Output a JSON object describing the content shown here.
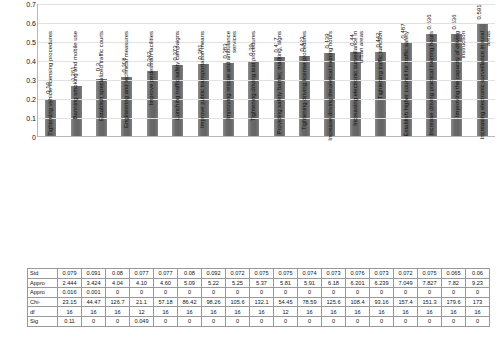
{
  "chart_data": {
    "type": "bar",
    "title": "",
    "xlabel": "",
    "ylabel": "",
    "ylim": [
      0,
      0.7
    ],
    "grid": true,
    "legend": "none",
    "y_ticks": [
      "0",
      "0.1",
      "0.2",
      "0.3",
      "0.4",
      "0.5",
      "0.6",
      "0.7"
    ],
    "bar_color": "#6f6f6f",
    "categories": [
      "Tightening vehicle licensing procedures",
      "Banning smoking and mobile use",
      "Establish specialized traffic courts",
      "Engineering and technical measures",
      "Improve pedestrian facilities",
      "Lunching traffic safety campaigns",
      "Improve public transportation means",
      "Improving rescue and ambulance services",
      "Tightening driving test procedures",
      "Providing safety barrier, marking, signs",
      "Tightening driving license procedures",
      "Increase driving theoretical training hours",
      "Increasing electronic surveillance in urban areas",
      "Tightening traffic sanction",
      "Establish higher council for traffic safety",
      "Increase driving practical training hours",
      "Improving the capacity of driving instruction",
      "Increasing electronic surveillance in rural areas"
    ],
    "values": [
      0.19,
      0.261,
      0.3,
      0.308,
      0.342,
      0.373,
      0.381,
      0.383,
      0.39,
      0.417,
      0.423,
      0.439,
      0.44,
      0.442,
      0.487,
      0.536,
      0.536,
      0.591
    ],
    "value_labels": [
      "0.19",
      "0.261",
      "0.3",
      "0.308",
      "0.342",
      "0.373",
      "0.381",
      "0.383",
      "0.39",
      "0.417",
      "0.423",
      "0.439",
      "0.44",
      "0.442",
      "0.487",
      "0.536",
      "0.536",
      "0.591"
    ]
  },
  "stats_table": {
    "row_labels": [
      "Std",
      "Appro",
      "Appro",
      "Chi-",
      "df",
      "Sig"
    ],
    "rows": [
      [
        "0.079",
        "0.091",
        "0.08",
        "0.077",
        "0.077",
        "0.08",
        "0.092",
        "0.072",
        "0.075",
        "0.075",
        "0.074",
        "0.073",
        "0.076",
        "0.073",
        "0.072",
        "0.075",
        "0.065",
        "0.06"
      ],
      [
        "2.444",
        "3.424",
        "4.04",
        "4.10",
        "4.60",
        "5.09",
        "5.22",
        "5.25",
        "5.37",
        "5.81",
        "5.91",
        "6.18",
        "6.201",
        "6.239",
        "7.049",
        "7.827",
        "7.82",
        "9.23"
      ],
      [
        "0.016",
        "0.001",
        "0",
        "0",
        "0",
        "0",
        "0",
        "0",
        "0",
        "0",
        "0",
        "0",
        "0",
        "0",
        "0",
        "0",
        "0",
        "0"
      ],
      [
        "23.15",
        "44.47",
        "126.7",
        "21.1",
        "57.18",
        "86.42",
        "98.26",
        "105.6",
        "132.1",
        "54.45",
        "78.59",
        "125.6",
        "108.4",
        "93.16",
        "157.4",
        "151.3",
        "179.6",
        "173"
      ],
      [
        "16",
        "16",
        "16",
        "12",
        "16",
        "16",
        "16",
        "16",
        "16",
        "12",
        "16",
        "16",
        "16",
        "16",
        "16",
        "16",
        "16",
        "16"
      ],
      [
        "0.11",
        "0",
        "0",
        "0.049",
        "0",
        "0",
        "0",
        "0",
        "0",
        "0",
        "0",
        "0",
        "0",
        "0",
        "0",
        "0",
        "0",
        "0"
      ]
    ]
  }
}
